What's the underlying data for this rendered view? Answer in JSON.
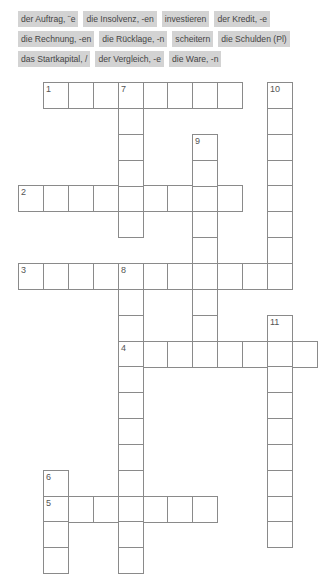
{
  "word_bank": {
    "rows": [
      [
        "der Auftrag, ¨e",
        "die Insolvenz, -en",
        "investieren",
        "der Kredit, -e"
      ],
      [
        "die Rechnung, -en",
        "die Rücklage, -n",
        "scheitern",
        "die Schulden (Pl)"
      ],
      [
        "das Startkapital, /",
        "der Vergleich, -e",
        "die Ware, -n"
      ]
    ]
  },
  "crossword": {
    "origin": {
      "x": 18,
      "y": 82
    },
    "pitch": {
      "x": 24.9,
      "y": 25.85
    },
    "words": [
      {
        "number": "1",
        "direction": "across",
        "row": 0,
        "col": 1,
        "length": 8
      },
      {
        "number": "2",
        "direction": "across",
        "row": 4,
        "col": 0,
        "length": 9
      },
      {
        "number": "3",
        "direction": "across",
        "row": 7,
        "col": 0,
        "length": 11
      },
      {
        "number": "4",
        "direction": "across",
        "row": 10,
        "col": 4,
        "length": 8
      },
      {
        "number": "5",
        "direction": "across",
        "row": 16,
        "col": 1,
        "length": 7
      },
      {
        "number": "6",
        "direction": "down",
        "row": 15,
        "col": 1,
        "length": 4
      },
      {
        "number": "7",
        "direction": "down",
        "row": 0,
        "col": 4,
        "length": 6
      },
      {
        "number": "8",
        "direction": "down",
        "row": 7,
        "col": 4,
        "length": 12
      },
      {
        "number": "9",
        "direction": "down",
        "row": 2,
        "col": 7,
        "length": 9
      },
      {
        "number": "10",
        "direction": "down",
        "row": 0,
        "col": 10,
        "length": 8
      },
      {
        "number": "11",
        "direction": "down",
        "row": 9,
        "col": 10,
        "length": 9
      }
    ]
  }
}
